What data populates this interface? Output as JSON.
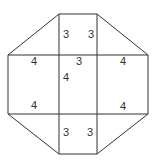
{
  "diagram": {
    "type": "octagon-net",
    "stroke_color": "#333333",
    "background": "#ffffff",
    "labels": [
      {
        "text": "3",
        "x": 66,
        "y": 35
      },
      {
        "text": "3",
        "x": 91,
        "y": 35
      },
      {
        "text": "4",
        "x": 34,
        "y": 62
      },
      {
        "text": "3",
        "x": 79,
        "y": 62
      },
      {
        "text": "4",
        "x": 123,
        "y": 62
      },
      {
        "text": "4",
        "x": 66,
        "y": 78
      },
      {
        "text": "4",
        "x": 34,
        "y": 106
      },
      {
        "text": "4",
        "x": 123,
        "y": 107
      },
      {
        "text": "3",
        "x": 66,
        "y": 133
      },
      {
        "text": "3",
        "x": 90,
        "y": 133
      }
    ]
  }
}
